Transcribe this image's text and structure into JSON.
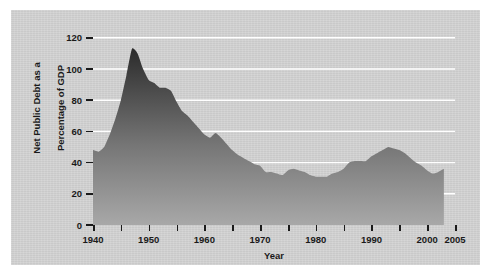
{
  "figure": {
    "background_color": "#d3d3d3",
    "page_color": "#ffffff"
  },
  "chart_data": {
    "type": "area",
    "title": "",
    "subtitle": "",
    "xlabel": "Year",
    "ylabel": "Net Public Debt as a\nPercentage of GDP",
    "ylabel_line1": "Net Public Debt as a",
    "ylabel_line2": "Percentage of GDP",
    "xlim": [
      1940,
      2005
    ],
    "ylim": [
      0,
      125
    ],
    "grid": true,
    "grid_color": "#ffffff",
    "grid_orientation": "horizontal",
    "legend": null,
    "legend_position": "none",
    "fill_gradient": {
      "top_color": "#2b2b2b",
      "bottom_color": "#a8a8a8"
    },
    "data_end_year": 2003,
    "y_ticks": [
      0,
      20,
      40,
      60,
      80,
      100,
      120
    ],
    "y_tick_labels": [
      "0",
      "20",
      "40",
      "60",
      "80",
      "100",
      "120"
    ],
    "x_ticks": [
      1940,
      1945,
      1950,
      1955,
      1960,
      1965,
      1970,
      1975,
      1980,
      1985,
      1990,
      1995,
      2000,
      2005
    ],
    "x_tick_labels_shown": [
      {
        "year": 1940,
        "label": "1940"
      },
      {
        "year": 1950,
        "label": "1950"
      },
      {
        "year": 1960,
        "label": "1960"
      },
      {
        "year": 1970,
        "label": "1970"
      },
      {
        "year": 1980,
        "label": "1980"
      },
      {
        "year": 1990,
        "label": "1990"
      },
      {
        "year": 2000,
        "label": "2000"
      },
      {
        "year": 2005,
        "label": "2005"
      }
    ],
    "series": [
      {
        "name": "Net Public Debt as a Percentage of GDP",
        "x": [
          1940,
          1941,
          1942,
          1943,
          1944,
          1945,
          1946,
          1947,
          1948,
          1949,
          1950,
          1951,
          1952,
          1953,
          1954,
          1955,
          1956,
          1957,
          1958,
          1959,
          1960,
          1961,
          1962,
          1963,
          1964,
          1965,
          1966,
          1967,
          1968,
          1969,
          1970,
          1971,
          1972,
          1973,
          1974,
          1975,
          1976,
          1977,
          1978,
          1979,
          1980,
          1981,
          1982,
          1983,
          1984,
          1985,
          1986,
          1987,
          1988,
          1989,
          1990,
          1991,
          1992,
          1993,
          1994,
          1995,
          1996,
          1997,
          1998,
          1999,
          2000,
          2001,
          2002,
          2003
        ],
        "values": [
          48,
          47,
          50,
          58,
          68,
          80,
          96,
          113,
          110,
          100,
          93,
          91,
          88,
          88,
          86,
          79,
          73,
          70,
          66,
          62,
          58,
          56,
          59,
          56,
          52,
          48,
          45,
          43,
          41,
          39,
          38,
          34,
          34,
          33,
          32,
          35,
          36,
          35,
          34,
          32,
          31,
          31,
          31,
          33,
          34,
          36,
          40,
          41,
          41,
          41,
          44,
          46,
          48,
          50,
          49,
          48,
          46,
          43,
          40,
          38,
          35,
          33,
          34,
          36
        ]
      }
    ],
    "annotations": []
  }
}
